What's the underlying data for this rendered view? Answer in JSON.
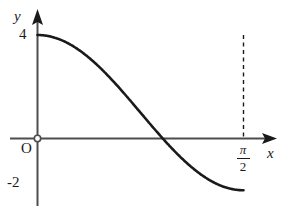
{
  "figure": {
    "background_color": "#ffffff",
    "ink_color": "#1a1a1a",
    "axis_color": "#4d4d4d"
  },
  "labels": {
    "y_axis": "y",
    "x_axis": "x",
    "origin": "O",
    "y_tick_top": "4",
    "y_tick_bottom": "-2",
    "x_tick_pi_numerator": "π",
    "x_tick_pi_denominator": "2"
  },
  "chart_data": {
    "type": "line",
    "title": "",
    "subtitle": "",
    "xlabel": "x",
    "ylabel": "y",
    "grid": false,
    "legend": "none",
    "xlim": [
      0,
      1.5707963
    ],
    "ylim": [
      -2,
      4
    ],
    "xticks": [
      0,
      1.5707963
    ],
    "xticklabels": [
      "O",
      "π/2"
    ],
    "yticks": [
      -2,
      0,
      4
    ],
    "yticklabels": [
      "-2",
      "O",
      "4"
    ],
    "annotations": [
      {
        "text": "dashed vertical drop line at x = π/2 from y = 4 to y = 0"
      },
      {
        "text": "open circle marker at origin"
      }
    ],
    "series": [
      {
        "name": "curve",
        "expression": "y = 3cos(2x) + 1",
        "color": "#1a1a1a",
        "x": [
          0,
          0.0785,
          0.1571,
          0.2356,
          0.3142,
          0.3927,
          0.4712,
          0.5498,
          0.6283,
          0.7069,
          0.7854,
          0.8639,
          0.9425,
          1.021,
          1.0996,
          1.1781,
          1.2566,
          1.3352,
          1.4137,
          1.4923,
          1.5708
        ],
        "y": [
          4.0,
          3.927,
          3.714,
          3.373,
          2.927,
          2.405,
          1.841,
          1.272,
          0.727,
          0.236,
          -0.177,
          -0.5,
          -0.727,
          -0.854,
          -0.881,
          -0.809,
          -0.641,
          -0.382,
          -0.038,
          0.382,
          0.854
        ]
      }
    ],
    "key_points": [
      {
        "label": "start",
        "x": 0,
        "y": 4
      },
      {
        "label": "first zero crossing",
        "x": 0.8,
        "y": 0
      },
      {
        "label": "minimum",
        "x": 1.17,
        "y": -2
      },
      {
        "label": "second zero crossing",
        "x": 1.53,
        "y": 0
      },
      {
        "label": "end",
        "x": 1.5708,
        "y": 4
      }
    ]
  }
}
